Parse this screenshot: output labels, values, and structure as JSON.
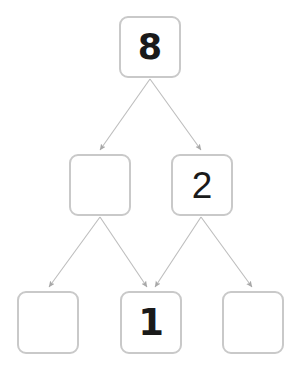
{
  "diagram": {
    "type": "tree",
    "background_color": "#ffffff",
    "node_border_color": "#c9c9c9",
    "node_fill_color": "#ffffff",
    "edge_color": "#b9b9b9",
    "text_color": "#1a1a1a",
    "levels": 3,
    "nodes": [
      {
        "id": "root",
        "level": 0,
        "position": "top-center",
        "label": "8",
        "empty": false
      },
      {
        "id": "mid-left",
        "level": 1,
        "position": "middle-left",
        "label": "",
        "empty": true
      },
      {
        "id": "mid-right",
        "level": 1,
        "position": "middle-right",
        "label": "2",
        "empty": false
      },
      {
        "id": "leaf-left",
        "level": 2,
        "position": "bottom-left",
        "label": "",
        "empty": true
      },
      {
        "id": "leaf-center",
        "level": 2,
        "position": "bottom-center",
        "label": "1",
        "empty": false
      },
      {
        "id": "leaf-right",
        "level": 2,
        "position": "bottom-right",
        "label": "",
        "empty": true
      }
    ],
    "edges": [
      {
        "from": "root",
        "to": "mid-left",
        "arrow": true
      },
      {
        "from": "root",
        "to": "mid-right",
        "arrow": true
      },
      {
        "from": "mid-left",
        "to": "leaf-left",
        "arrow": true
      },
      {
        "from": "mid-left",
        "to": "leaf-center",
        "arrow": true
      },
      {
        "from": "mid-right",
        "to": "leaf-center",
        "arrow": true
      },
      {
        "from": "mid-right",
        "to": "leaf-right",
        "arrow": true
      }
    ]
  }
}
